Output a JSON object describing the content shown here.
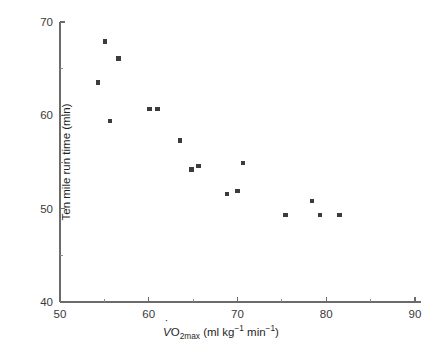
{
  "chart_data": {
    "type": "scatter",
    "title": "",
    "xlabel": "VO2max (ml kg-1 min-1)",
    "ylabel": "Ten mile run time (min)",
    "xlim": [
      50,
      90
    ],
    "ylim": [
      40,
      70
    ],
    "xticks": [
      50,
      60,
      70,
      80,
      90
    ],
    "xtick_labels": [
      "50",
      "60",
      "70",
      "80",
      "90"
    ],
    "x_minor_ticks": [
      55,
      65,
      75,
      85
    ],
    "yticks": [
      40,
      50,
      60,
      70
    ],
    "ytick_labels": [
      "40",
      "50",
      "60",
      "70"
    ],
    "y_minor_ticks": [
      45,
      55,
      65
    ],
    "grid": false,
    "legend": null,
    "marker": "square",
    "marker_color": "#3c3c3c",
    "points": [
      {
        "x": 54.3,
        "y": 63.5
      },
      {
        "x": 55.1,
        "y": 67.9
      },
      {
        "x": 55.6,
        "y": 59.4
      },
      {
        "x": 56.6,
        "y": 66.1
      },
      {
        "x": 60.1,
        "y": 60.7
      },
      {
        "x": 61.0,
        "y": 60.7
      },
      {
        "x": 63.5,
        "y": 57.3
      },
      {
        "x": 64.8,
        "y": 54.2
      },
      {
        "x": 65.6,
        "y": 54.6
      },
      {
        "x": 68.8,
        "y": 51.6
      },
      {
        "x": 70.0,
        "y": 51.9
      },
      {
        "x": 70.6,
        "y": 54.9
      },
      {
        "x": 75.4,
        "y": 49.3
      },
      {
        "x": 78.4,
        "y": 50.8
      },
      {
        "x": 79.3,
        "y": 49.3
      },
      {
        "x": 81.5,
        "y": 49.3
      }
    ]
  },
  "axis_titles": {
    "x_prefix": "V",
    "x_o": "O",
    "x_sub": "2max",
    "x_rest_open": " (ml kg",
    "x_sup1": "−1",
    "x_mid": " min",
    "x_sup2": "−1",
    "x_close": ")",
    "y": "Ten mile run time (min)"
  }
}
